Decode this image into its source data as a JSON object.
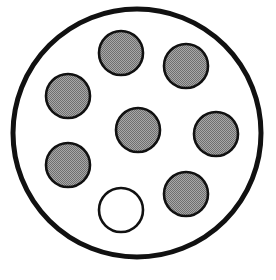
{
  "figure": {
    "canvas": {
      "width": 276,
      "height": 280
    },
    "background_color": "#ffffff"
  },
  "style": {
    "outer_stroke_color": "#111111",
    "outer_stroke_width": 5,
    "outer_fill": "#ffffff",
    "inner_stroke_color": "#111111",
    "inner_stroke_width": 2.6,
    "filled_color": "#8d8d8d",
    "halftone_dark": "#6f6f6f",
    "halftone_light": "#a8a8a8",
    "unfilled_color": "#ffffff"
  },
  "outer_circle": {
    "label": "outer-boundary-circle",
    "cx": 137,
    "cy": 133,
    "r": 124,
    "fill_state": "empty"
  },
  "inner_circles": [
    {
      "label": "circle-top",
      "position": "top",
      "cx": 121,
      "cy": 53,
      "r": 22,
      "fill_state": "filled"
    },
    {
      "label": "circle-upper-right",
      "position": "upper-right",
      "cx": 186,
      "cy": 66,
      "r": 22,
      "fill_state": "filled"
    },
    {
      "label": "circle-upper-left",
      "position": "upper-left",
      "cx": 68,
      "cy": 96,
      "r": 22,
      "fill_state": "filled"
    },
    {
      "label": "circle-center",
      "position": "center",
      "cx": 138,
      "cy": 130,
      "r": 22,
      "fill_state": "filled"
    },
    {
      "label": "circle-right",
      "position": "middle-right",
      "cx": 216,
      "cy": 134,
      "r": 22,
      "fill_state": "filled"
    },
    {
      "label": "circle-lower-left",
      "position": "lower-left",
      "cx": 68,
      "cy": 165,
      "r": 22,
      "fill_state": "filled"
    },
    {
      "label": "circle-lower-right",
      "position": "lower-right",
      "cx": 186,
      "cy": 194,
      "r": 22,
      "fill_state": "filled"
    },
    {
      "label": "circle-bottom-empty",
      "position": "bottom-center",
      "cx": 121,
      "cy": 210,
      "r": 22,
      "fill_state": "empty"
    }
  ],
  "counts": {
    "total_inner_circles": 8,
    "filled_circles": 7,
    "empty_circles": 1
  }
}
